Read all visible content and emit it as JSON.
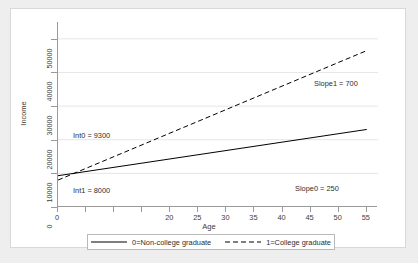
{
  "chart_data": {
    "type": "line",
    "title": "",
    "xlabel": "Age",
    "ylabel": "Income",
    "xlim": [
      0,
      57
    ],
    "ylim": [
      0,
      55000
    ],
    "grid": true,
    "x_ticks": [
      {
        "value": 0,
        "label": "0"
      },
      {
        "value": 5,
        "label": ""
      },
      {
        "value": 10,
        "label": ""
      },
      {
        "value": 15,
        "label": ""
      },
      {
        "value": 20,
        "label": "20"
      },
      {
        "value": 25,
        "label": "25"
      },
      {
        "value": 30,
        "label": "30"
      },
      {
        "value": 35,
        "label": "35"
      },
      {
        "value": 40,
        "label": "40"
      },
      {
        "value": 45,
        "label": "45"
      },
      {
        "value": 50,
        "label": "50"
      },
      {
        "value": 55,
        "label": "55"
      }
    ],
    "y_ticks": [
      {
        "value": 0,
        "label": "0"
      },
      {
        "value": 10000,
        "label": "10000"
      },
      {
        "value": 20000,
        "label": "20000"
      },
      {
        "value": 30000,
        "label": "30000"
      },
      {
        "value": 40000,
        "label": "40000"
      },
      {
        "value": 50000,
        "label": "50000"
      }
    ],
    "series": [
      {
        "name": "0=Non-college graduate",
        "style": "solid",
        "color": "#000000",
        "intercept": 9300,
        "slope": 250,
        "x": [
          0,
          55
        ],
        "values": [
          9300,
          23050
        ]
      },
      {
        "name": "1=College graduate",
        "style": "dashed",
        "color": "#000000",
        "intercept": 8000,
        "slope": 700,
        "x": [
          0,
          55
        ],
        "values": [
          8000,
          46500
        ]
      }
    ],
    "annotations": [
      {
        "id": "int0",
        "text": "Int0 = 9300",
        "x_px": 62,
        "y_px": 122
      },
      {
        "id": "int1",
        "text": "Int1 = 8000",
        "x_px": 62,
        "y_px": 177
      },
      {
        "id": "slope1",
        "text": "Slope1 = 700",
        "x_px": 303,
        "y_px": 70
      },
      {
        "id": "slope0",
        "text": "Slope0 = 250",
        "x_px": 284,
        "y_px": 175
      }
    ],
    "legend": {
      "position": "bottom",
      "entries": [
        {
          "label": "0=Non-college graduate",
          "style": "solid"
        },
        {
          "label": "1=College graduate",
          "style": "dashed"
        }
      ]
    }
  },
  "colors": {
    "page_background": "#eeeeee",
    "panel_background": "#ffffff",
    "axis": "#9a9a9a",
    "grid": "#e6e6e6",
    "text": "#2d2d2d"
  }
}
